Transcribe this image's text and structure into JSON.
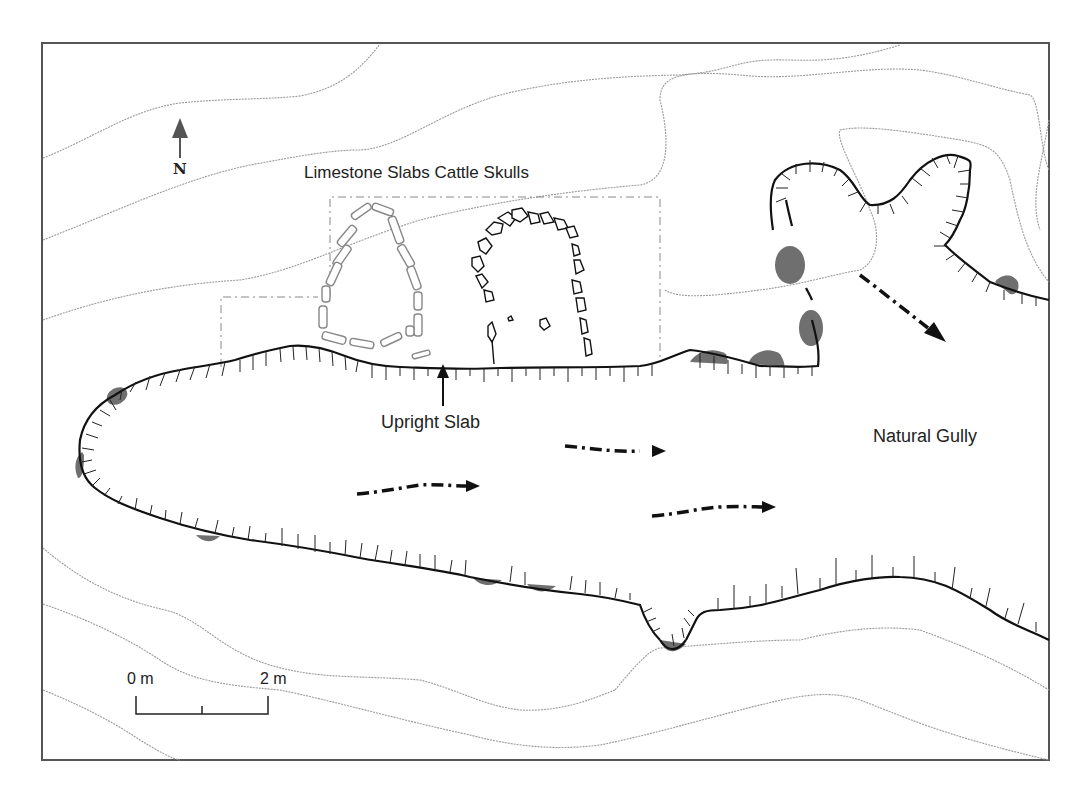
{
  "figure": {
    "labels": {
      "limestone_slabs": "Limestone Slabs",
      "cattle_skulls": "Cattle Skulls",
      "title_line": "Limestone Slabs Cattle Skulls",
      "upright_slab": "Upright Slab",
      "natural_gully": "Natural Gully",
      "north": "N"
    },
    "scale_bar": {
      "start_label": "0 m",
      "end_label": "2 m",
      "divisions": 2
    },
    "colors": {
      "background": "#ffffff",
      "frame": "#555555",
      "edge_line": "#111111",
      "contour_line": "#9a9a9a",
      "stone_fill": "#6f6f6f",
      "slab_outline": "#888888",
      "skull_outline": "#111111",
      "flow_arrow": "#111111"
    },
    "features": {
      "flow_arrows": 4,
      "contour_lines": 7,
      "excavation_trench_outline": "dash-dot"
    }
  }
}
